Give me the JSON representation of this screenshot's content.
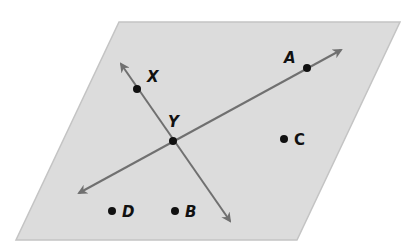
{
  "diagram": {
    "plane": {
      "fill": "#dcdcdc",
      "edge": "#c4c4c4",
      "vertices": [
        [
          119,
          22
        ],
        [
          400,
          22
        ],
        [
          297,
          240
        ],
        [
          16,
          240
        ]
      ]
    },
    "line_color": "#707070",
    "point_color": "#111111",
    "lines": [
      {
        "id": "line-XY",
        "from": [
          121,
          64
        ],
        "to": [
          230,
          221
        ],
        "through": [
          "X",
          "Y"
        ]
      },
      {
        "id": "line-AY",
        "from": [
          79,
          193
        ],
        "to": [
          341,
          50
        ],
        "through": [
          "A",
          "Y"
        ]
      }
    ],
    "points": [
      {
        "name": "X",
        "label": "X",
        "x": 137,
        "y": 89,
        "label_x": 147,
        "label_y": 82,
        "italic": true
      },
      {
        "name": "A",
        "label": "A",
        "x": 307,
        "y": 68,
        "label_x": 284,
        "label_y": 63,
        "italic": true
      },
      {
        "name": "Y",
        "label": "Y",
        "x": 173,
        "y": 141,
        "label_x": 168,
        "label_y": 127,
        "italic": true
      },
      {
        "name": "C",
        "label": "C",
        "x": 284,
        "y": 139,
        "label_x": 294,
        "label_y": 145,
        "italic": false
      },
      {
        "name": "D",
        "label": "D",
        "x": 112,
        "y": 211,
        "label_x": 122,
        "label_y": 217,
        "italic": true
      },
      {
        "name": "B",
        "label": "B",
        "x": 175,
        "y": 211,
        "label_x": 185,
        "label_y": 217,
        "italic": true
      }
    ]
  }
}
